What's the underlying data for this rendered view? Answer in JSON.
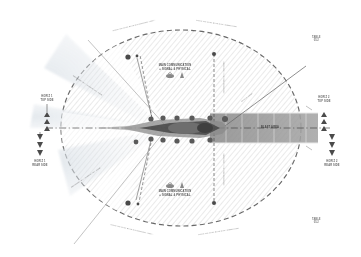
{
  "diagram": {
    "type": "technical-plan-drawing",
    "colors": {
      "hatch": "#c9c9c9",
      "boundary": "#4b4b4b",
      "band": "#9a9a9a",
      "wedge": "#e3e6ea",
      "vessel": "#5d5d5d",
      "accent": "#7e7e7e"
    }
  },
  "corners": {
    "top_right_line1": "TABLE",
    "top_right_line2": "05.2",
    "bottom_right_line1": "TABLE",
    "bottom_right_line2": "05.2"
  },
  "arc_labels": {
    "top_left": "LIMIT OF THE SHIP'S TURNING AREA",
    "top_right": "LIMIT OF THE SHIP'S MANOEUVRE",
    "bottom_left": "LIMIT OF THE SHIP'S TURNING AREA",
    "bottom_right": "LIMIT OF THE SHIP'S MANOEUVRE"
  },
  "zones": {
    "upper_sector_label_line1": "MAIN COMMUNICATION",
    "upper_sector_label_line2": "+ SIGNAL & PHYSICAL",
    "lower_sector_label_line1": "MAIN COMMUNICATION",
    "lower_sector_label_line2": "+ SIGNAL & PHYSICAL",
    "band_label": "BLAST AREA"
  },
  "dimension_labels": {
    "left_top_line1": "HORIZ 1",
    "left_top_line2": "TOP SIDE",
    "left_bottom_line1": "HORIZ 1",
    "left_bottom_line2": "REAR SIDE",
    "right_top_line1": "HORIZ 2",
    "right_top_line2": "TOP SIDE",
    "right_bottom_line1": "HORIZ 2",
    "right_bottom_line2": "REAR SIDE"
  },
  "callouts": {
    "upper_left_diag": "SECONDARY APPROACH LINE",
    "lower_left_diag": "SECONDARY APPROACH LINE",
    "upper_right_diag": "SIGHT LINE",
    "axis_upper": "CENTRE AXIS REFERENCE",
    "axis_lower": "CENTRE AXIS REFERENCE"
  },
  "markers": {
    "node_count_upper": 6,
    "node_count_lower": 6,
    "triangle_up": "▲",
    "triangle_down": "▼"
  }
}
